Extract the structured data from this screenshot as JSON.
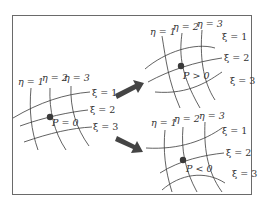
{
  "figure": {
    "panels": [
      {
        "id": "original",
        "eta_labels": [
          "η = 1",
          "η = 2",
          "η = 3"
        ],
        "xi_labels": [
          "ξ = 1",
          "ξ = 2",
          "ξ = 3"
        ],
        "point_label": "P = 0"
      },
      {
        "id": "attracted-up",
        "eta_labels": [
          "η = 1",
          "η = 2",
          "η = 3"
        ],
        "xi_labels": [
          "ξ = 1",
          "ξ = 2",
          "ξ = 3"
        ],
        "point_label": "P > 0"
      },
      {
        "id": "attracted-down",
        "eta_labels": [
          "η = 1",
          "η = 2",
          "η = 3"
        ],
        "xi_labels": [
          "ξ = 1",
          "ξ = 2",
          "ξ = 3"
        ],
        "point_label": "P < 0"
      }
    ],
    "arrows": [
      "arrow-to-p-positive",
      "arrow-to-p-negative"
    ],
    "colors": {
      "lines": "#3a3a3a",
      "frame": "#6a6a6a",
      "arrow": "#444444"
    }
  }
}
